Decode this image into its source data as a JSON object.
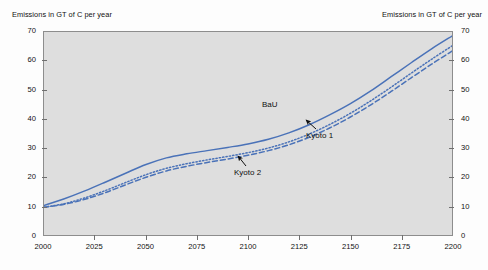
{
  "figure": {
    "left_axis_title": "Emissions in GT of C per year",
    "right_axis_title": "Emissions in GT of C per year",
    "line_color": "#4a72b8",
    "plot_background": "#dedede",
    "page_background": "#fdfdfd"
  },
  "annotations": [
    {
      "label": "BaU",
      "series": "BaU"
    },
    {
      "label": "Kyoto 1",
      "series": "Kyoto 1"
    },
    {
      "label": "Kyoto 2",
      "series": "Kyoto 2"
    }
  ],
  "chart_data": {
    "type": "line",
    "title": "",
    "xlabel": "",
    "ylabel": "Emissions in GT of C per year",
    "y2label": "Emissions in GT of C per year",
    "xlim": [
      2000,
      2200
    ],
    "ylim": [
      0,
      70
    ],
    "grid": false,
    "legend": "annotated-inline",
    "xticks": [
      2000,
      2025,
      2050,
      2075,
      2100,
      2125,
      2150,
      2175,
      2200
    ],
    "yticks": [
      0,
      10,
      20,
      30,
      40,
      50,
      60,
      70
    ],
    "xtick_labels": [
      "2000",
      "2025",
      "2050",
      "2075",
      "2100",
      "2125",
      "2150",
      "2175",
      "2200"
    ],
    "ytick_labels": [
      "0",
      "10",
      "20",
      "30",
      "40",
      "50",
      "60",
      "70"
    ],
    "y2tick_labels": [
      "0",
      "10",
      "20",
      "30",
      "40",
      "50",
      "60",
      "70"
    ],
    "x": [
      2000,
      2010,
      2020,
      2030,
      2040,
      2050,
      2060,
      2070,
      2080,
      2090,
      2100,
      2110,
      2120,
      2130,
      2140,
      2150,
      2160,
      2170,
      2180,
      2190,
      2200
    ],
    "series": [
      {
        "name": "BaU",
        "style": "solid",
        "color": "#4a72b8",
        "values": [
          10.2,
          12.5,
          15.2,
          18.2,
          21.3,
          24.3,
          26.6,
          28.0,
          29.1,
          30.2,
          31.4,
          33.0,
          35.2,
          38.0,
          41.4,
          45.2,
          49.6,
          54.5,
          59.4,
          64.2,
          68.6
        ]
      },
      {
        "name": "Kyoto 1",
        "style": "dotted",
        "color": "#4a72b8",
        "values": [
          9.6,
          10.8,
          12.8,
          15.3,
          18.1,
          20.8,
          23.0,
          24.6,
          25.9,
          27.1,
          28.4,
          30.0,
          32.1,
          34.8,
          38.1,
          41.9,
          46.2,
          50.9,
          55.8,
          60.6,
          65.2
        ]
      },
      {
        "name": "Kyoto 2",
        "style": "dashed",
        "color": "#4a72b8",
        "values": [
          9.6,
          10.6,
          12.3,
          14.6,
          17.3,
          19.9,
          22.1,
          23.7,
          25.0,
          26.2,
          27.5,
          29.1,
          31.1,
          33.7,
          36.9,
          40.6,
          44.8,
          49.4,
          54.2,
          58.9,
          63.4
        ]
      }
    ]
  }
}
